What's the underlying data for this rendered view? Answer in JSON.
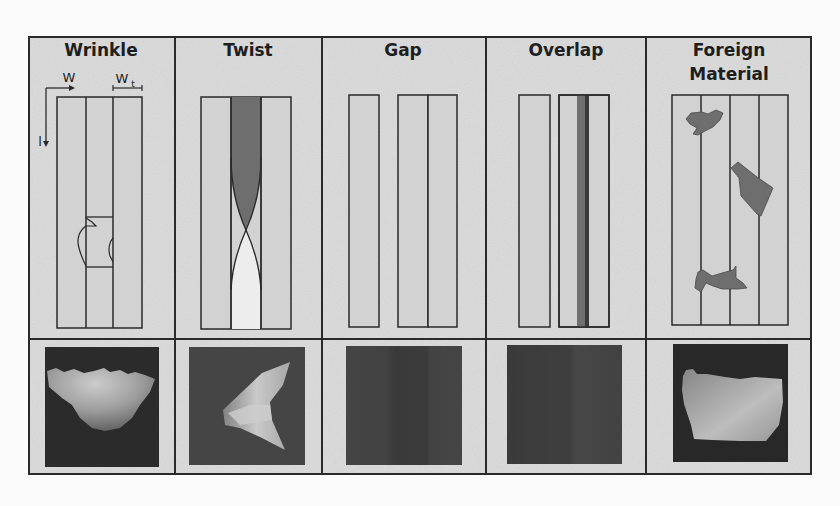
{
  "figure": {
    "colors": {
      "page_bg": "#fbfbfb",
      "cell_bg": "#dcdcdc",
      "strip_fill": "#d0d0d0",
      "border": "#2a2a2a",
      "defect_dark": "#6e6e6e",
      "defect_darker": "#4a4a4a",
      "twist_light": "#ececec",
      "image_bg_dark": "#333333"
    },
    "columns": [
      {
        "id": "wrinkle",
        "title_lines": [
          "Wrinkle"
        ],
        "annotations": {
          "w_label": "W",
          "wt_label": "W",
          "wt_subscript": "t",
          "l_label": "l"
        },
        "photo_caption": "Wrinkle defect depth image"
      },
      {
        "id": "twist",
        "title_lines": [
          "Twist"
        ],
        "photo_caption": "Twist defect depth image"
      },
      {
        "id": "gap",
        "title_lines": [
          "Gap"
        ],
        "photo_caption": "Gap defect depth image"
      },
      {
        "id": "overlap",
        "title_lines": [
          "Overlap"
        ],
        "photo_caption": "Overlap defect depth image"
      },
      {
        "id": "foreign-material",
        "title_lines": [
          "Foreign",
          "Material"
        ],
        "photo_caption": "Foreign material defect depth image"
      }
    ]
  }
}
